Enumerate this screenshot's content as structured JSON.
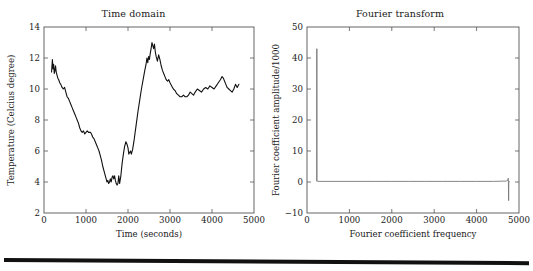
{
  "figure": {
    "background_color": "#ffffff",
    "line_color": "#111111",
    "axis_color": "#555555",
    "page_rule": "horizontal-rule"
  },
  "panels": [
    {
      "id": "time-domain",
      "title": "Time domain",
      "xlabel": "Time (seconds)",
      "ylabel": "Temperature (Celcius degree)",
      "xticks": [
        "0",
        "1000",
        "2000",
        "3000",
        "4000",
        "5000"
      ],
      "yticks": [
        "2",
        "4",
        "6",
        "8",
        "10",
        "12",
        "14"
      ]
    },
    {
      "id": "fourier-transform",
      "title": "Fourier transform",
      "xlabel": "Fourier coefficient frequency",
      "ylabel": "Fourier coefficient amplitude/1000",
      "xticks": [
        "0",
        "1000",
        "2000",
        "3000",
        "4000",
        "5000"
      ],
      "yticks": [
        "-10",
        "0",
        "10",
        "20",
        "30",
        "40",
        "50"
      ]
    }
  ],
  "chart_data": [
    {
      "type": "line",
      "title": "Time domain",
      "xlabel": "Time (seconds)",
      "ylabel": "Temperature (Celcius degree)",
      "xlim": [
        0,
        5000
      ],
      "ylim": [
        2,
        14
      ],
      "xticks": [
        0,
        1000,
        2000,
        3000,
        4000,
        5000
      ],
      "yticks": [
        2,
        4,
        6,
        8,
        10,
        12,
        14
      ],
      "grid": false,
      "legend": "none",
      "series": [
        {
          "name": "Temperature",
          "x": [
            180,
            200,
            215,
            230,
            245,
            260,
            275,
            290,
            310,
            330,
            350,
            375,
            400,
            430,
            460,
            490,
            520,
            550,
            580,
            610,
            640,
            670,
            700,
            730,
            760,
            790,
            820,
            850,
            880,
            910,
            940,
            970,
            1000,
            1030,
            1060,
            1090,
            1110,
            1130,
            1160,
            1190,
            1220,
            1250,
            1280,
            1310,
            1340,
            1370,
            1400,
            1430,
            1460,
            1480,
            1500,
            1520,
            1540,
            1560,
            1580,
            1600,
            1620,
            1640,
            1660,
            1680,
            1700,
            1720,
            1740,
            1760,
            1780,
            1800,
            1830,
            1860,
            1890,
            1920,
            1950,
            1980,
            2000,
            2020,
            2040,
            2060,
            2080,
            2110,
            2140,
            2170,
            2200,
            2240,
            2280,
            2320,
            2360,
            2400,
            2430,
            2450,
            2470,
            2490,
            2510,
            2530,
            2550,
            2570,
            2590,
            2610,
            2630,
            2650,
            2670,
            2700,
            2730,
            2760,
            2790,
            2820,
            2850,
            2880,
            2910,
            2940,
            2970,
            3000,
            3040,
            3080,
            3120,
            3160,
            3200,
            3240,
            3280,
            3320,
            3360,
            3400,
            3440,
            3480,
            3520,
            3560,
            3600,
            3650,
            3700,
            3750,
            3800,
            3850,
            3900,
            3950,
            4000,
            4050,
            4100,
            4150,
            4200,
            4240,
            4270,
            4300,
            4330,
            4360,
            4400,
            4440,
            4480,
            4520,
            4560,
            4600,
            4640
          ],
          "y": [
            11.1,
            11.9,
            11.3,
            11.6,
            11.0,
            11.2,
            11.5,
            11.1,
            10.9,
            10.7,
            10.6,
            10.4,
            10.3,
            10.1,
            10.0,
            10.1,
            9.8,
            9.5,
            9.4,
            9.2,
            9.0,
            8.8,
            8.6,
            8.4,
            8.2,
            8.0,
            7.8,
            7.5,
            7.3,
            7.2,
            7.3,
            7.1,
            7.2,
            7.3,
            7.2,
            7.2,
            7.2,
            7.1,
            6.9,
            6.8,
            6.6,
            6.4,
            6.2,
            6.0,
            5.7,
            5.4,
            5.0,
            4.7,
            4.4,
            4.2,
            4.0,
            4.1,
            3.9,
            4.0,
            4.2,
            4.0,
            4.3,
            4.4,
            4.2,
            4.4,
            4.1,
            3.9,
            3.8,
            3.9,
            4.4,
            3.9,
            4.4,
            5.2,
            5.8,
            6.3,
            6.6,
            6.4,
            6.2,
            5.8,
            5.9,
            6.0,
            5.8,
            6.1,
            6.6,
            7.2,
            7.8,
            8.6,
            9.3,
            10.0,
            10.6,
            11.2,
            11.6,
            12.0,
            11.7,
            12.1,
            11.9,
            12.3,
            12.6,
            13.0,
            12.8,
            12.6,
            12.9,
            12.4,
            12.1,
            11.8,
            12.2,
            11.9,
            11.5,
            11.2,
            11.0,
            10.8,
            10.6,
            10.5,
            10.6,
            10.4,
            10.2,
            10.0,
            9.9,
            9.7,
            9.6,
            9.5,
            9.5,
            9.6,
            9.5,
            9.5,
            9.6,
            9.8,
            9.7,
            9.6,
            9.8,
            10.0,
            9.9,
            9.8,
            10.0,
            10.1,
            10.0,
            10.2,
            10.1,
            10.0,
            10.2,
            10.4,
            10.6,
            10.8,
            10.7,
            10.5,
            10.3,
            10.1,
            10.0,
            9.9,
            9.8,
            10.0,
            10.3,
            10.1,
            10.3
          ]
        }
      ]
    },
    {
      "type": "line",
      "title": "Fourier transform",
      "xlabel": "Fourier coefficient frequency",
      "ylabel": "Fourier coefficient amplitude/1000",
      "xlim": [
        0,
        5000
      ],
      "ylim": [
        -10,
        50
      ],
      "xticks": [
        0,
        1000,
        2000,
        3000,
        4000,
        5000
      ],
      "yticks": [
        -10,
        0,
        10,
        20,
        30,
        40,
        50
      ],
      "grid": false,
      "legend": "none",
      "series": [
        {
          "name": "Fourier coefficient amplitude",
          "x": [
            230,
            232,
            234,
            240,
            260,
            400,
            800,
            1200,
            1600,
            2000,
            2400,
            2800,
            3200,
            3600,
            4000,
            4400,
            4700,
            4740,
            4745,
            4750,
            4755,
            4760,
            4780
          ],
          "y": [
            0.2,
            43.0,
            0.4,
            0.3,
            0.2,
            0.2,
            0.2,
            0.2,
            0.2,
            0.2,
            0.2,
            0.2,
            0.2,
            0.2,
            0.2,
            0.2,
            0.3,
            0.6,
            1.2,
            0.3,
            -6.0,
            0.2,
            0.2
          ]
        }
      ]
    }
  ]
}
